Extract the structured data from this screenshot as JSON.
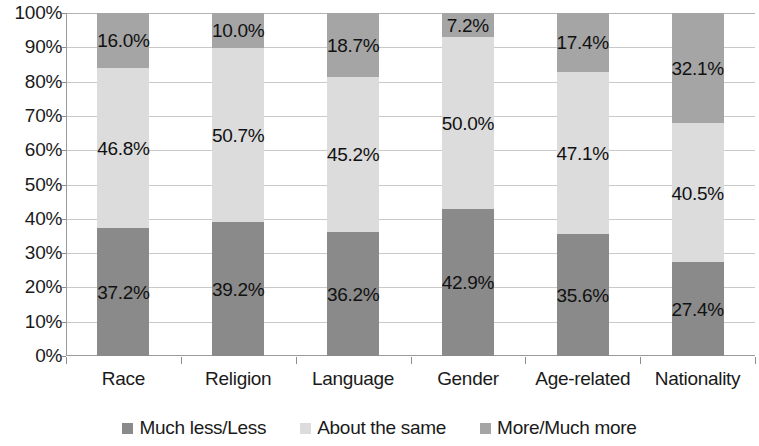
{
  "chart_data": {
    "type": "bar",
    "subtype": "100% stacked column",
    "title": "",
    "subtitle": "",
    "xlabel": "",
    "ylabel": "",
    "categories": [
      "Race",
      "Religion",
      "Language",
      "Gender",
      "Age-related",
      "Nationality"
    ],
    "series": [
      {
        "name": "Much less/Less",
        "color": "#8a8a8a",
        "values": [
          37.2,
          39.2,
          36.2,
          42.9,
          35.6,
          27.4
        ],
        "labels": [
          "37.2%",
          "39.2%",
          "36.2%",
          "42.9%",
          "35.6%",
          "27.4%"
        ]
      },
      {
        "name": "About the same",
        "color": "#dcdcdc",
        "values": [
          46.8,
          50.7,
          45.2,
          50.0,
          47.1,
          40.5
        ],
        "labels": [
          "46.8%",
          "50.7%",
          "45.2%",
          "50.0%",
          "47.1%",
          "40.5%"
        ]
      },
      {
        "name": "More/Much more",
        "color": "#a5a5a5",
        "values": [
          16.0,
          10.0,
          18.7,
          7.2,
          17.4,
          32.1
        ],
        "labels": [
          "16.0%",
          "10.0%",
          "18.7%",
          "7.2%",
          "17.4%",
          "32.1%"
        ]
      }
    ],
    "ylim": [
      0,
      100
    ],
    "ytick_step": 10,
    "ytick_labels": [
      "100%",
      "90%",
      "80%",
      "70%",
      "60%",
      "50%",
      "40%",
      "30%",
      "20%",
      "10%",
      "0%"
    ],
    "ytick_values": [
      100,
      90,
      80,
      70,
      60,
      50,
      40,
      30,
      20,
      10,
      0
    ],
    "grid": "horizontal",
    "legend_position": "bottom",
    "stack_order_bottom_to_top": [
      "Much less/Less",
      "About the same",
      "More/Much more"
    ],
    "background_color": "#ffffff",
    "gridline_color": "#c9c9c9",
    "axis_color": "#9a9a9a",
    "label_text_color": "#111111"
  },
  "legend": {
    "items": [
      {
        "label": "Much less/Less",
        "color": "#8a8a8a"
      },
      {
        "label": "About the same",
        "color": "#dcdcdc"
      },
      {
        "label": "More/Much more",
        "color": "#a5a5a5"
      }
    ]
  }
}
